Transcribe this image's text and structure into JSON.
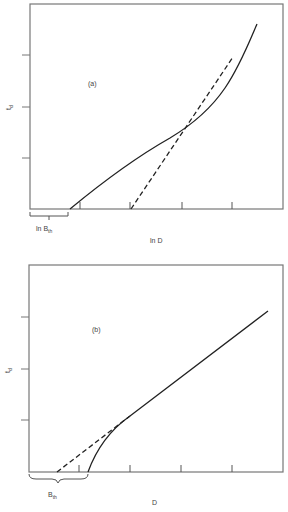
{
  "panels": [
    {
      "id": "a",
      "tag": "(a)",
      "ylabel": "t",
      "ylabel_sub": "d",
      "xlabel": "ln D",
      "threshold_label": "ln B",
      "threshold_sub": "th",
      "curves": [
        {
          "name": "measured",
          "style": "solid"
        },
        {
          "name": "extrapolation",
          "style": "dashed"
        }
      ]
    },
    {
      "id": "b",
      "tag": "(b)",
      "ylabel": "t",
      "ylabel_sub": "d",
      "xlabel": "D",
      "threshold_label": "B",
      "threshold_sub": "th",
      "curves": [
        {
          "name": "measured",
          "style": "solid"
        },
        {
          "name": "extrapolation",
          "style": "dashed"
        }
      ]
    }
  ],
  "colors": {
    "frame": "#777777",
    "curve": "#222222",
    "text": "#444444"
  }
}
